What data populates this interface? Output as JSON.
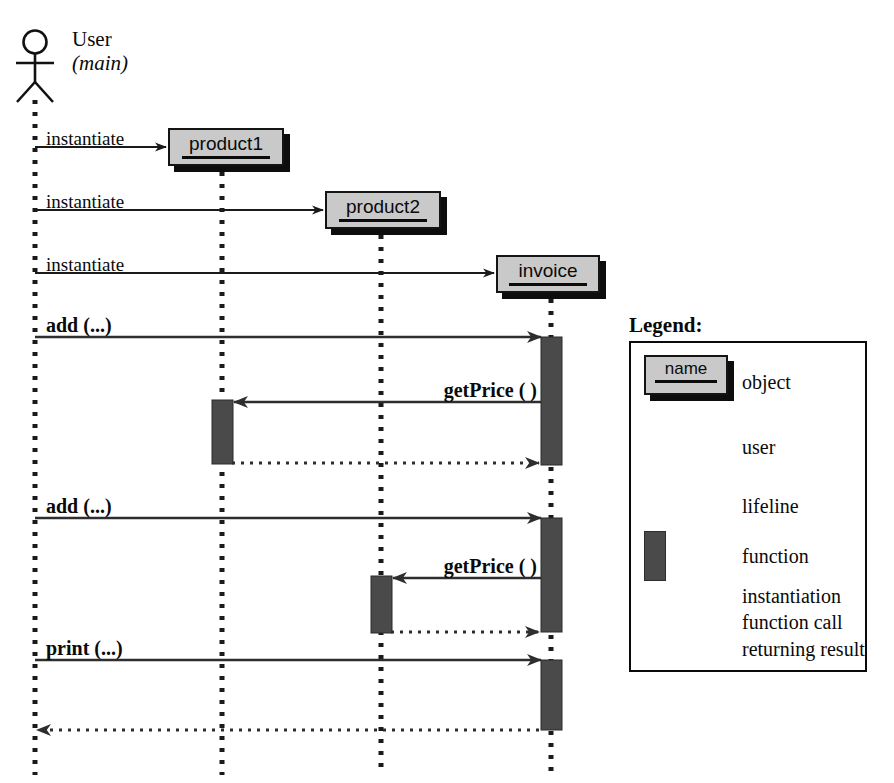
{
  "diagram": {
    "type": "uml-sequence-diagram",
    "actor": {
      "name": "User",
      "stereotype": "(main)",
      "lifeline_x": 35
    },
    "objects": [
      {
        "id": "product1",
        "label": "product1",
        "lifeline_x": 222,
        "box": {
          "x": 168,
          "y": 128,
          "w": 116,
          "h": 38
        }
      },
      {
        "id": "product2",
        "label": "product2",
        "lifeline_x": 381,
        "box": {
          "x": 325,
          "y": 191,
          "w": 116,
          "h": 38
        }
      },
      {
        "id": "invoice",
        "label": "invoice",
        "lifeline_x": 551,
        "box": {
          "x": 496,
          "y": 255,
          "w": 104,
          "h": 38
        }
      }
    ],
    "messages": [
      {
        "label": "instantiate",
        "kind": "instantiation",
        "from_x": 35,
        "to_x": 166,
        "y": 147,
        "bold": false,
        "label_x": 46,
        "label_y": 129,
        "label_align": "left"
      },
      {
        "label": "instantiate",
        "kind": "instantiation",
        "from_x": 35,
        "to_x": 323,
        "y": 210,
        "bold": false,
        "label_x": 46,
        "label_y": 192,
        "label_align": "left"
      },
      {
        "label": "instantiate",
        "kind": "instantiation",
        "from_x": 35,
        "to_x": 494,
        "y": 273,
        "bold": false,
        "label_x": 46,
        "label_y": 255,
        "label_align": "left"
      },
      {
        "label": "add (...)",
        "kind": "function-call",
        "from_x": 35,
        "to_x": 541,
        "y": 337,
        "bold": true,
        "label_x": 46,
        "label_y": 315,
        "label_align": "left"
      },
      {
        "label": "getPrice ( )",
        "kind": "function-call",
        "from_x": 541,
        "to_x": 234,
        "y": 402,
        "bold": true,
        "label_x": 537,
        "label_y": 380,
        "label_align": "right"
      },
      {
        "label": "",
        "kind": "returning-result",
        "from_x": 232,
        "to_x": 539,
        "y": 463,
        "bold": false,
        "label_x": 0,
        "label_y": 0,
        "label_align": "left"
      },
      {
        "label": "add (...)",
        "kind": "function-call",
        "from_x": 35,
        "to_x": 541,
        "y": 518,
        "bold": true,
        "label_x": 46,
        "label_y": 496,
        "label_align": "left"
      },
      {
        "label": "getPrice ( )",
        "kind": "function-call",
        "from_x": 541,
        "to_x": 393,
        "y": 578,
        "bold": true,
        "label_x": 537,
        "label_y": 556,
        "label_align": "right"
      },
      {
        "label": "",
        "kind": "returning-result",
        "from_x": 391,
        "to_x": 539,
        "y": 632,
        "bold": false,
        "label_x": 0,
        "label_y": 0,
        "label_align": "left"
      },
      {
        "label": "print (...)",
        "kind": "function-call",
        "from_x": 35,
        "to_x": 541,
        "y": 660,
        "bold": true,
        "label_x": 46,
        "label_y": 638,
        "label_align": "left"
      },
      {
        "label": "",
        "kind": "returning-result",
        "from_x": 539,
        "to_x": 37,
        "y": 730,
        "bold": false,
        "label_x": 0,
        "label_y": 0,
        "label_align": "left"
      }
    ],
    "activations": [
      {
        "on": "invoice",
        "x": 541,
        "y": 337,
        "w": 21,
        "h": 128
      },
      {
        "on": "product1",
        "x": 212,
        "y": 400,
        "w": 21,
        "h": 64
      },
      {
        "on": "invoice",
        "x": 541,
        "y": 518,
        "w": 21,
        "h": 114
      },
      {
        "on": "product2",
        "x": 371,
        "y": 576,
        "w": 21,
        "h": 57
      },
      {
        "on": "invoice",
        "x": 541,
        "y": 660,
        "w": 21,
        "h": 70
      }
    ],
    "lifeline_bottom": 775
  },
  "legend": {
    "title": "Legend:",
    "box": {
      "x": 629,
      "y": 341,
      "w": 238,
      "h": 331
    },
    "entries": [
      {
        "id": "object",
        "label": "object",
        "sample": "object-box"
      },
      {
        "id": "user",
        "label": "user",
        "sample": "stick-figure"
      },
      {
        "id": "lifeline",
        "label": "lifeline",
        "sample": "dotted-line"
      },
      {
        "id": "function",
        "label": "function",
        "sample": "activation-bar"
      },
      {
        "id": "instantiation",
        "label": "instantiation",
        "sample": "thin-arrow"
      },
      {
        "id": "function-call",
        "label": "function call",
        "sample": "solid-arrow"
      },
      {
        "id": "returning-result",
        "label": "returning result",
        "sample": "dotted-arrow"
      }
    ],
    "sample_name": "name"
  },
  "colors": {
    "object_fill": "#c9c9c9",
    "object_border": "#141414",
    "object_shadow": "#0d0d0d",
    "activation_fill": "#4a4a4a",
    "line": "#1a1a1a",
    "background": "#ffffff"
  }
}
